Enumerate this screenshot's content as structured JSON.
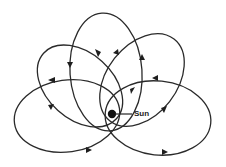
{
  "diagram": {
    "type": "precessing-orbit",
    "sun": {
      "label": "Sun",
      "x": 112,
      "y": 114
    },
    "orbits": [
      {
        "name": "orbit-bottom-left",
        "cx": 67,
        "cy": 116,
        "rx": 53,
        "ry": 36,
        "rot": -8
      },
      {
        "name": "orbit-left-top",
        "cx": 82,
        "cy": 86,
        "rx": 48,
        "ry": 33,
        "rot": 40
      },
      {
        "name": "orbit-top",
        "cx": 107,
        "cy": 72,
        "rx": 37,
        "ry": 59,
        "rot": -2
      },
      {
        "name": "orbit-right-top",
        "cx": 142,
        "cy": 80,
        "rx": 53,
        "ry": 36,
        "rot": -55
      },
      {
        "name": "orbit-right",
        "cx": 158,
        "cy": 116,
        "rx": 54,
        "ry": 38,
        "rot": 5
      }
    ],
    "colors": {
      "line": "#2a2a2a",
      "sun": "#111111",
      "background": "#ffffff"
    }
  }
}
